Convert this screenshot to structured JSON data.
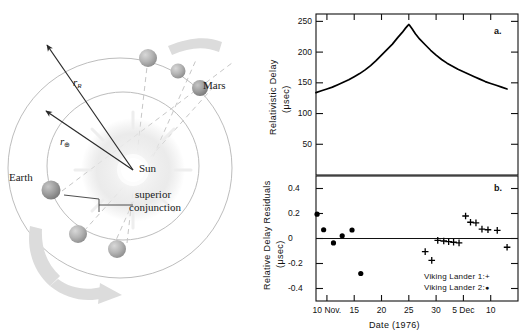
{
  "figure": {
    "diagram": {
      "title_labels": {
        "sun": "Sun",
        "earth": "Earth",
        "mars": "Mars",
        "superior_conjunction_line1": "superior",
        "superior_conjunction_line2": "conjunction",
        "r_R": "r",
        "r_R_sub": "R",
        "r_earth": "r",
        "r_earth_sub": "⊕"
      },
      "description": "Orbital geometry of Earth and Mars around the Sun at superior conjunction",
      "colors": {
        "orbit_line": "#b9b9b9",
        "dashed_ray": "#c2c2c2",
        "planet": "#b0b0b0",
        "motion_arrow": "#d8d8d8",
        "sun_glow": "#e8e8e8",
        "vector": "#2a2a2a"
      }
    }
  },
  "chart_data": [
    {
      "type": "line",
      "panel_id": "a.",
      "title": "",
      "ylabel": "Relativistic Delay",
      "ylabel_units": "(μsec)",
      "xlabel": "",
      "ylim": [
        0,
        262
      ],
      "yticks": [
        50,
        100,
        150,
        200,
        250
      ],
      "xlim": [
        7.5,
        13.5
      ],
      "xticks_days": [
        10,
        15,
        20,
        25,
        30,
        35,
        40
      ],
      "xticklabels": [
        "10 Nov.",
        "15",
        "20",
        "25",
        "30",
        "5 Dec",
        "10"
      ],
      "grid": false,
      "legend": "none",
      "peak_value": 245,
      "peak_date_day": 25,
      "x": [
        8.0,
        9.0,
        10.0,
        11.0,
        12.0,
        13.0,
        14.0,
        15.0,
        16.0,
        17.0,
        18.0,
        19.0,
        20.0,
        21.0,
        22.0,
        23.0,
        23.8,
        24.4,
        24.8,
        25.0,
        25.2,
        25.6,
        26.2,
        27.0,
        28.0,
        29.0,
        30.0,
        31.0,
        32.0,
        33.0,
        34.0,
        35.0,
        36.0,
        37.0,
        38.0,
        39.0,
        40.0,
        41.0,
        42.0,
        43.0
      ],
      "y": [
        134,
        137,
        140,
        143,
        147,
        151,
        155,
        160,
        165,
        171,
        178,
        186,
        195,
        204,
        213,
        224,
        232,
        239,
        243,
        245,
        243,
        238,
        230,
        221,
        212,
        203,
        195,
        188,
        182,
        177,
        172,
        168,
        164,
        160,
        156,
        152,
        149,
        146,
        143,
        140
      ]
    },
    {
      "type": "scatter",
      "panel_id": "b.",
      "title": "",
      "ylabel": "Relative Delay Residuals",
      "ylabel_units": "(μsec)",
      "xlabel": "Date (1976)",
      "ylim": [
        -0.5,
        0.5
      ],
      "yticks": [
        0.4,
        0.2,
        0,
        -0.2,
        -0.4
      ],
      "yticklabels": [
        "0.4",
        "0.2",
        "0",
        "-0.2",
        "-0.4"
      ],
      "xlim": [
        7.5,
        13.5
      ],
      "xticks_days": [
        10,
        15,
        20,
        25,
        30,
        35,
        40
      ],
      "xticklabels": [
        "10 Nov.",
        "15",
        "20",
        "25",
        "30",
        "5 Dec",
        "10"
      ],
      "grid": false,
      "zero_line": true,
      "legend_position": "inside-bottom-right",
      "series": [
        {
          "name": "Viking Lander 1",
          "marker": "+",
          "legend_label": "Viking Lander 1:",
          "x": [
            28.0,
            29.2,
            30.3,
            31.4,
            32.3,
            33.2,
            34.2,
            35.4,
            36.3,
            37.3,
            38.4,
            39.5,
            41.2,
            43.0
          ],
          "y": [
            -0.105,
            -0.175,
            -0.015,
            -0.02,
            -0.025,
            -0.03,
            -0.035,
            0.18,
            0.13,
            0.125,
            0.075,
            0.07,
            0.065,
            -0.07
          ]
        },
        {
          "name": "Viking Lander 2",
          "marker": "●",
          "legend_label": "Viking Lander 2:",
          "x": [
            8.2,
            9.4,
            11.2,
            12.8,
            14.6,
            16.2
          ],
          "y": [
            0.195,
            0.07,
            -0.035,
            0.022,
            0.068,
            -0.28
          ]
        }
      ]
    }
  ]
}
